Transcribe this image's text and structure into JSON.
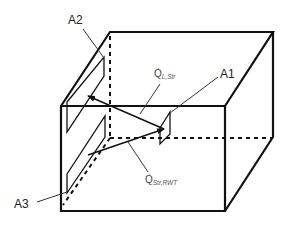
{
  "figure": {
    "type": "3d-box-schematic"
  },
  "labels": {
    "a1": "A1",
    "a2": "A2",
    "a3": "A3",
    "q_l_str": {
      "symbol": "Q",
      "dot": "·",
      "subscript": "L,Str"
    },
    "q_str_rwt": {
      "symbol": "Q",
      "dot": "·",
      "subscript": "Str,RWT"
    }
  },
  "colors": {
    "line": "#111111",
    "leader": "#555555",
    "text": "#222222"
  }
}
